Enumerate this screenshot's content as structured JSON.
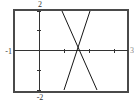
{
  "chart_data": {
    "type": "line",
    "title": "",
    "xlabel": "",
    "ylabel": "",
    "xlim": [
      -1,
      3.56
    ],
    "ylim": [
      -2,
      2
    ],
    "x_ticks": [
      1,
      2,
      3
    ],
    "y_ticks": [
      -2,
      -1,
      1,
      2
    ],
    "grid": false,
    "legend": false,
    "frame": true,
    "axis_edge_labels": {
      "top": "2",
      "bottom": "-2",
      "left": "-1",
      "right": "3"
    },
    "series": [
      {
        "name": "falling-line",
        "points": [
          [
            0.92,
            2
          ],
          [
            2.32,
            -2
          ]
        ]
      },
      {
        "name": "rising-line",
        "points": [
          [
            1.0,
            -2
          ],
          [
            2.04,
            2
          ]
        ]
      }
    ],
    "colors": {
      "frame": "#4a4a4a",
      "axis": "#333333",
      "line": "#161616",
      "label": "#333333"
    }
  }
}
